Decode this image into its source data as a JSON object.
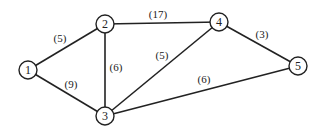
{
  "diagram": {
    "type": "weighted-undirected-graph",
    "nodes": [
      {
        "id": "1",
        "label": "1",
        "x": 28,
        "y": 70
      },
      {
        "id": "2",
        "label": "2",
        "x": 105,
        "y": 24
      },
      {
        "id": "3",
        "label": "3",
        "x": 105,
        "y": 116
      },
      {
        "id": "4",
        "label": "4",
        "x": 219,
        "y": 22
      },
      {
        "id": "5",
        "label": "5",
        "x": 298,
        "y": 66
      }
    ],
    "edges": [
      {
        "from": "1",
        "to": "2",
        "weight": "(5)",
        "lx": 60,
        "ly": 42
      },
      {
        "from": "1",
        "to": "3",
        "weight": "(9)",
        "lx": 71,
        "ly": 88
      },
      {
        "from": "2",
        "to": "3",
        "weight": "(6)",
        "lx": 116,
        "ly": 71
      },
      {
        "from": "2",
        "to": "4",
        "weight": "(17)",
        "lx": 158,
        "ly": 18
      },
      {
        "from": "3",
        "to": "4",
        "weight": "(5)",
        "lx": 162,
        "ly": 59
      },
      {
        "from": "4",
        "to": "5",
        "weight": "(3)",
        "lx": 262,
        "ly": 38
      },
      {
        "from": "3",
        "to": "5",
        "weight": "(6)",
        "lx": 204,
        "ly": 83
      }
    ]
  }
}
